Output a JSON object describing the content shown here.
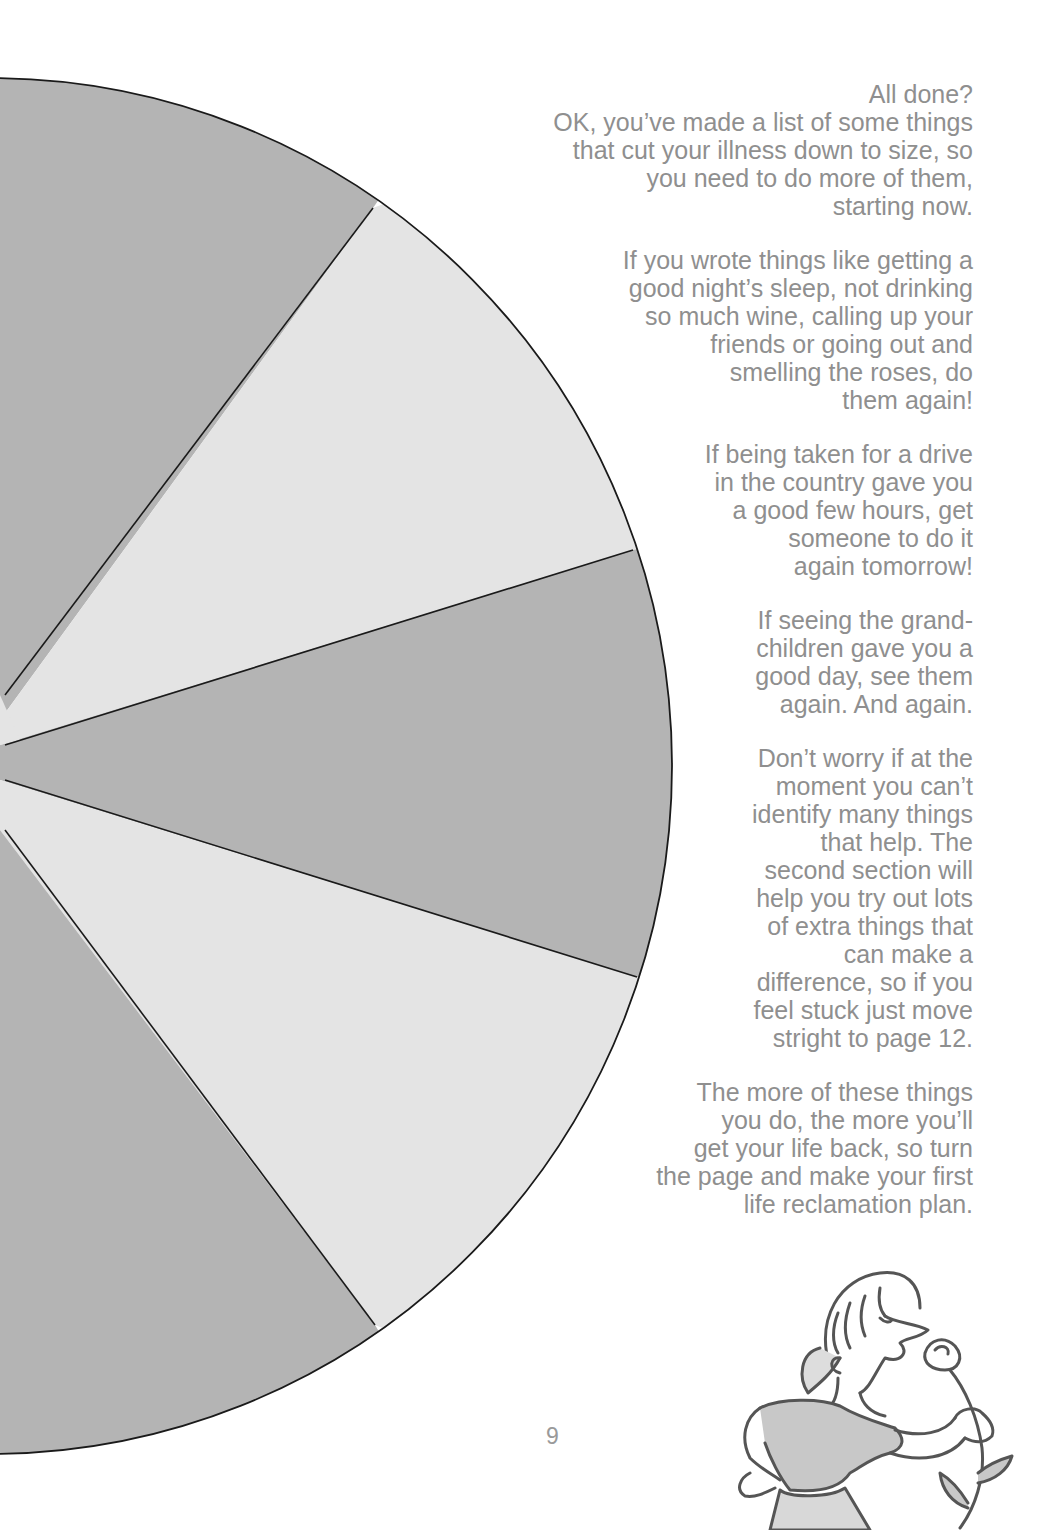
{
  "page": {
    "number": "9",
    "colors": {
      "text": "#8f8f8f",
      "wedge_dark": "#b4b4b4",
      "wedge_light": "#e4e4e4",
      "outline": "#1a1a1a",
      "background": "#ffffff"
    }
  },
  "pie_graphic": {
    "description": "Half-circle pie divided into alternating dark and light wedges",
    "wedges": [
      {
        "shade": "dark"
      },
      {
        "shade": "light"
      },
      {
        "shade": "dark"
      },
      {
        "shade": "light"
      },
      {
        "shade": "dark"
      }
    ]
  },
  "body_text": {
    "paragraphs": [
      "All done?\nOK, you’ve made a list of some things\nthat cut your illness down to size, so\nyou need to do more of them,\nstarting now.",
      "If you wrote things like getting a\ngood night’s sleep, not drinking\nso much wine, calling up your\nfriends or going out and\nsmelling the roses, do\nthem again!",
      "If being taken for a drive\nin the country gave you\na good few hours, get\nsomeone to do it\nagain tomorrow!",
      "If seeing the grand-\nchildren gave you a\ngood day, see them\nagain. And again.",
      "Don’t worry if at the\nmoment you can’t\nidentify many things\nthat help. The\nsecond section will\nhelp you try out lots\nof extra things that\ncan make a\ndifference, so if you\nfeel stuck just move\nstright to page 12.",
      "The more of these things\nyou do, the more you’ll\nget your life back, so turn\nthe page and make your first\nlife reclamation plan."
    ]
  },
  "illustration": {
    "subject": "woman-smelling-rose-icon"
  }
}
